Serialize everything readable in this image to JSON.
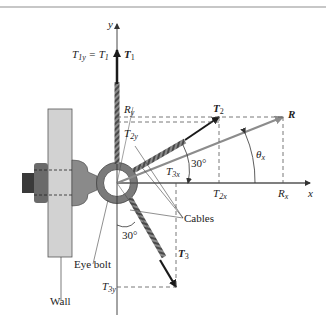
{
  "figure": {
    "type": "free-body force diagram",
    "top_rule_color": "#b5b5b5"
  },
  "axes": {
    "x_label": "x",
    "y_label": "y"
  },
  "forces": {
    "T1": {
      "label": "T",
      "sub": "1",
      "component_label": "T",
      "component_sub": "1y",
      "eq": " = ",
      "rhs": "T",
      "rhs_sub": "1"
    },
    "T2": {
      "label": "T",
      "sub": "2",
      "x_comp": "T",
      "x_comp_sub": "2x",
      "y_comp": "T",
      "y_comp_sub": "2y",
      "angle": "30°"
    },
    "T3": {
      "label": "T",
      "sub": "3",
      "x_comp": "T",
      "x_comp_sub": "3x",
      "y_comp": "T",
      "y_comp_sub": "3y",
      "angle": "30°"
    },
    "R": {
      "label": "R",
      "x_comp": "R",
      "x_comp_sub": "x",
      "y_comp": "R",
      "y_comp_sub": "y",
      "angle": "θ",
      "angle_sub": "x"
    }
  },
  "callouts": {
    "cables": "Cables",
    "eye_bolt": "Eye bolt",
    "wall": "Wall"
  },
  "colors": {
    "force_arrow": "#1a1a1a",
    "resultant_arrow": "#8c8c8c",
    "wall_fill": "#d2d2d2",
    "bolt_fill": "#7a7a7a",
    "cable": "#6d6d6d",
    "dashed": "#555555"
  }
}
